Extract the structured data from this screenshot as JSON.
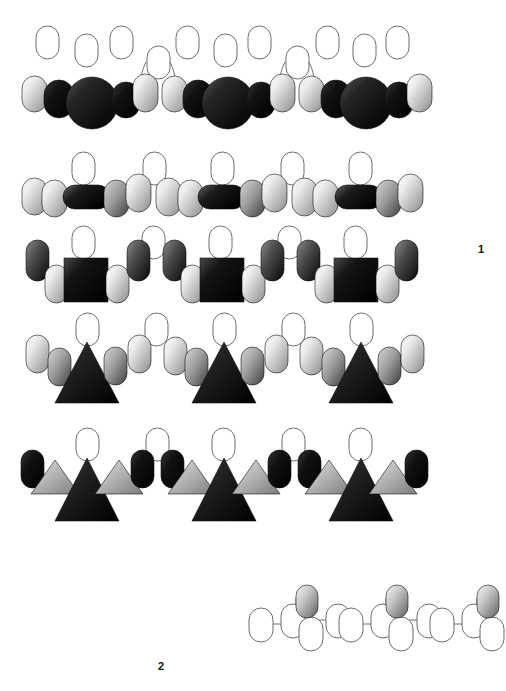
{
  "figure": {
    "background_color": "#ffffff",
    "width": 506,
    "height": 691,
    "labels": [
      {
        "id": "label-1",
        "text": "1",
        "x": 478,
        "y": 243
      },
      {
        "id": "label-2",
        "text": "2",
        "x": 158,
        "y": 660
      }
    ],
    "palette": {
      "outline": "#6d6d6d",
      "outline_fill": "#ffffff",
      "light_start": "#f2f2f2",
      "light_end": "#8f8f8f",
      "mid_start": "#c9c9c9",
      "mid_end": "#3a3a3a",
      "dark_start": "#6a6a6a",
      "dark_end": "#050505",
      "black_start": "#2a2a2a",
      "black_end": "#000000",
      "pale_start": "#e8e8e8",
      "pale_end": "#6a6a6a",
      "label_color": "#111111"
    },
    "rows": [
      {
        "id": "row-1",
        "name": "circle-capsule-chain-row",
        "y": 85,
        "description": "Row of alternating shaded capsules and large dark circles with outlined capsules above",
        "repeat_count": 3,
        "shapes": [
          "capsule-light",
          "capsule-black",
          "circle-large-dark",
          "capsule-black",
          "capsule-light"
        ],
        "top_outlines": 11,
        "connectors": 2
      },
      {
        "id": "row-2",
        "name": "wide-bar-capsule-chain-row",
        "y": 190,
        "description": "Row of shaded capsules joined by wide horizontal dark bars, outlined capsules above",
        "repeat_count": 3,
        "shapes": [
          "capsule-light",
          "capsule-light",
          "bar-wide-dark",
          "capsule-mid",
          "capsule-light"
        ],
        "top_outlines": 5
      },
      {
        "id": "row-3",
        "name": "square-capsule-chain-row",
        "y": 272,
        "description": "Row of dark squares flanked by shaded vertical capsules, outlined capsules above",
        "repeat_count": 3,
        "shapes": [
          "capsule-tall-dark",
          "capsule-light",
          "square-dark",
          "capsule-light"
        ],
        "top_outlines": 5
      },
      {
        "id": "row-4",
        "name": "triangle-capsule-chain-row",
        "y": 370,
        "description": "Row of large dark triangles flanked by shaded capsules, outlined capsules above",
        "repeat_count": 3,
        "shapes": [
          "capsule-light",
          "capsule-mid",
          "triangle-large-dark",
          "capsule-mid"
        ],
        "top_outlines": 5
      },
      {
        "id": "row-5",
        "name": "triangle-trio-chain-row",
        "y": 480,
        "description": "Row of large dark triangles flanked by small light triangles and black capsules",
        "repeat_count": 3,
        "shapes": [
          "capsule-black",
          "triangle-small-light",
          "triangle-large-dark",
          "triangle-small-light",
          "capsule-black"
        ],
        "top_outlines": 5
      },
      {
        "id": "row-6",
        "name": "outlined-capsule-chain-row",
        "y": 620,
        "description": "Lower-right chain of outlined capsules with bond connectors and shaded capsules above",
        "repeat_count": 3,
        "shapes": [
          "capsule-outline",
          "capsule-outline",
          "capsule-shaded-top",
          "capsule-outline-below",
          "capsule-outline"
        ],
        "x_start": 248
      }
    ]
  }
}
